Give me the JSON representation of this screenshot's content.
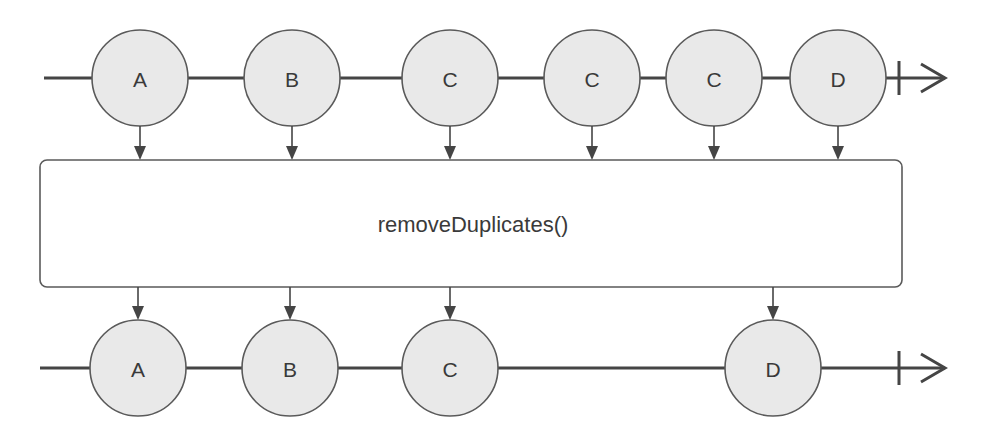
{
  "diagram": {
    "type": "marble-diagram",
    "colors": {
      "line": "#454545",
      "marble_fill": "#e9e9e9",
      "marble_stroke": "#5a5a5a",
      "box_stroke": "#5a5a5a",
      "text": "#3a3a3a"
    },
    "input_stream": {
      "y": 78,
      "start_x": 44,
      "completion_x": 899,
      "arrow_x": 945,
      "marbles": [
        {
          "label": "A",
          "x": 140
        },
        {
          "label": "B",
          "x": 292
        },
        {
          "label": "C",
          "x": 450
        },
        {
          "label": "C",
          "x": 592
        },
        {
          "label": "C",
          "x": 714
        },
        {
          "label": "D",
          "x": 838
        }
      ]
    },
    "operator": {
      "label": "removeDuplicates()",
      "box": {
        "x": 40,
        "y": 160,
        "width": 862,
        "height": 127,
        "radius": 7
      }
    },
    "output_stream": {
      "y": 368,
      "start_x": 40,
      "completion_x": 899,
      "arrow_x": 945,
      "marbles": [
        {
          "label": "A",
          "x": 138
        },
        {
          "label": "B",
          "x": 290
        },
        {
          "label": "C",
          "x": 450
        },
        {
          "label": "D",
          "x": 773
        }
      ]
    },
    "marble_radius": 48
  }
}
